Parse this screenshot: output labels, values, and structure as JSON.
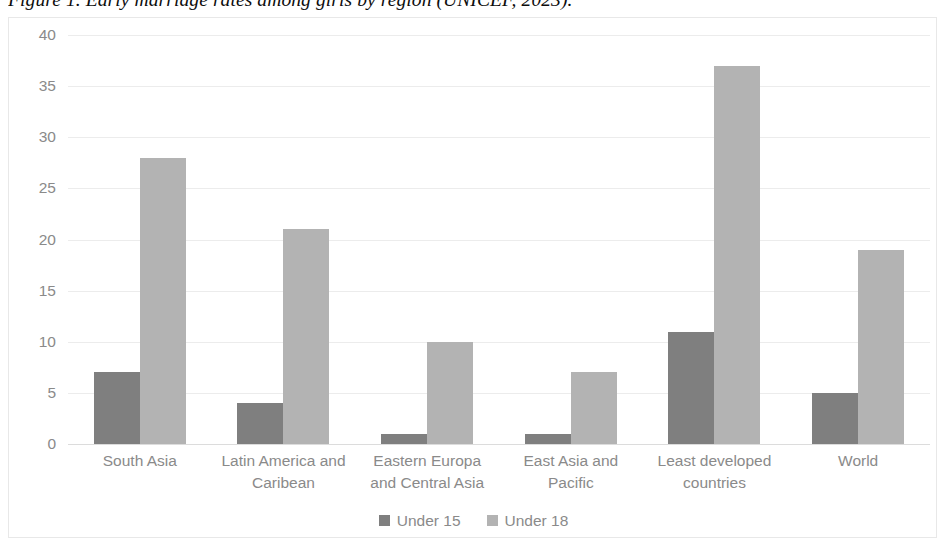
{
  "caption": "Figure 1. Early marriage rates among girls by region (UNICEF, 2023).",
  "colors": {
    "series_under_15": "#7f7f7f",
    "series_under_18": "#b3b3b3",
    "gridline": "#ececec",
    "axis_text": "#8a8a8a",
    "frame_border": "#e8e8e8",
    "caption_text": "#0d0d0d"
  },
  "chart_data": {
    "type": "bar",
    "title": "",
    "subtitle": "",
    "xlabel": "",
    "ylabel": "",
    "ylim": [
      0,
      40
    ],
    "yticks": [
      0,
      5,
      10,
      15,
      20,
      25,
      30,
      35,
      40
    ],
    "ytick_labels": [
      "0",
      "5",
      "10",
      "15",
      "20",
      "25",
      "30",
      "35",
      "40"
    ],
    "grid": true,
    "grid_axis": "y",
    "legend_position": "bottom",
    "categories": [
      "South Asia",
      "Latin America and Caribean",
      "Eastern Europa and Central Asia",
      "East Asia and Pacific",
      "Least developed countries",
      "World"
    ],
    "category_lines": [
      [
        "South Asia"
      ],
      [
        "Latin America and",
        "Caribean"
      ],
      [
        "Eastern Europa",
        "and Central Asia"
      ],
      [
        "East Asia and",
        "Pacific"
      ],
      [
        "Least developed",
        "countries"
      ],
      [
        "World"
      ]
    ],
    "series": [
      {
        "name": "Under 15",
        "color": "#7f7f7f",
        "values": [
          7,
          4,
          1,
          1,
          11,
          5
        ]
      },
      {
        "name": "Under 18",
        "color": "#b3b3b3",
        "values": [
          28,
          21,
          10,
          7,
          37,
          19
        ]
      }
    ]
  }
}
